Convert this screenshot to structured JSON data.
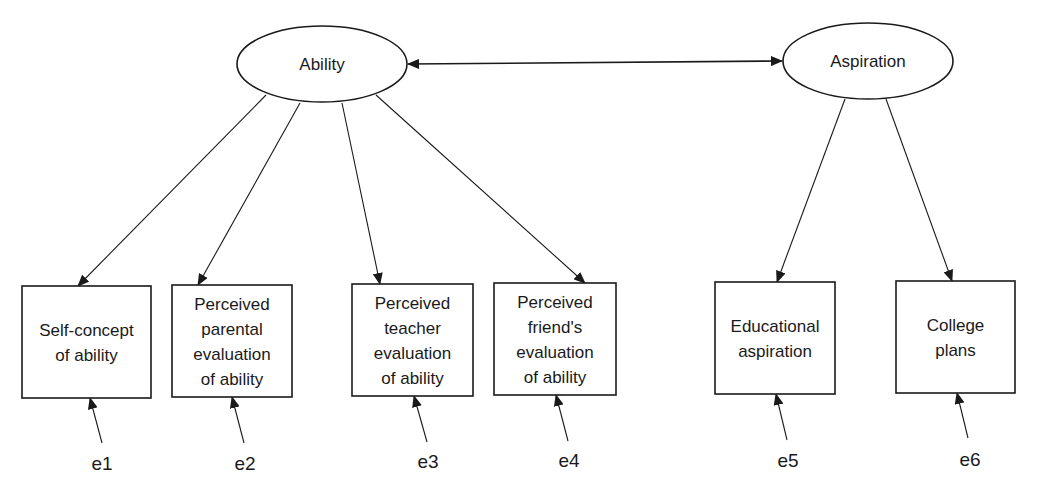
{
  "diagram": {
    "type": "structural-equation-model",
    "stroke_color": "#1a1a1a",
    "background": "#ffffff",
    "latent": [
      {
        "id": "ability",
        "label": "Ability",
        "cx": 322,
        "cy": 64,
        "rx": 85,
        "ry": 38
      },
      {
        "id": "aspiration",
        "label": "Aspiration",
        "cx": 868,
        "cy": 61,
        "rx": 85,
        "ry": 38
      }
    ],
    "correlation": {
      "from": "ability",
      "to": "aspiration",
      "type": "double-headed"
    },
    "observed": [
      {
        "id": "v1",
        "lines": [
          "Self-concept",
          "of ability"
        ],
        "x": 22,
        "y": 286,
        "w": 129,
        "h": 112,
        "factor": "ability",
        "error": "e1"
      },
      {
        "id": "v2",
        "lines": [
          "Perceived",
          "parental",
          "evaluation",
          "of ability"
        ],
        "x": 172,
        "y": 285,
        "w": 120,
        "h": 112,
        "factor": "ability",
        "error": "e2"
      },
      {
        "id": "v3",
        "lines": [
          "Perceived",
          "teacher",
          "evaluation",
          "of ability"
        ],
        "x": 352,
        "y": 284,
        "w": 121,
        "h": 112,
        "factor": "ability",
        "error": "e3"
      },
      {
        "id": "v4",
        "lines": [
          "Perceived",
          "friend's",
          "evaluation",
          "of ability"
        ],
        "x": 494,
        "y": 283,
        "w": 122,
        "h": 112,
        "factor": "ability",
        "error": "e4"
      },
      {
        "id": "v5",
        "lines": [
          "Educational",
          "aspiration"
        ],
        "x": 715,
        "y": 282,
        "w": 120,
        "h": 112,
        "factor": "aspiration",
        "error": "e5"
      },
      {
        "id": "v6",
        "lines": [
          "College",
          "plans"
        ],
        "x": 896,
        "y": 281,
        "w": 119,
        "h": 112,
        "factor": "aspiration",
        "error": "e6"
      }
    ],
    "loadings": [
      {
        "from": "ability",
        "to": "v1",
        "x1": 266,
        "y1": 95,
        "x2": 78,
        "y2": 286
      },
      {
        "from": "ability",
        "to": "v2",
        "x1": 300,
        "y1": 103,
        "x2": 198,
        "y2": 285
      },
      {
        "from": "ability",
        "to": "v3",
        "x1": 342,
        "y1": 103,
        "x2": 380,
        "y2": 284
      },
      {
        "from": "ability",
        "to": "v4",
        "x1": 376,
        "y1": 95,
        "x2": 585,
        "y2": 283
      },
      {
        "from": "aspiration",
        "to": "v5",
        "x1": 845,
        "y1": 99,
        "x2": 777,
        "y2": 282
      },
      {
        "from": "aspiration",
        "to": "v6",
        "x1": 886,
        "y1": 99,
        "x2": 952,
        "y2": 281
      }
    ],
    "errors": [
      {
        "label": "e1",
        "tx": 102,
        "ty": 470,
        "x1": 102,
        "y1": 443,
        "x2": 90,
        "y2": 398
      },
      {
        "label": "e2",
        "tx": 245,
        "ty": 470,
        "x1": 244,
        "y1": 443,
        "x2": 232,
        "y2": 397
      },
      {
        "label": "e3",
        "tx": 428,
        "ty": 468,
        "x1": 427,
        "y1": 442,
        "x2": 414,
        "y2": 396
      },
      {
        "label": "e4",
        "tx": 569,
        "ty": 467,
        "x1": 568,
        "y1": 441,
        "x2": 556,
        "y2": 395
      },
      {
        "label": "e5",
        "tx": 788,
        "ty": 467,
        "x1": 787,
        "y1": 440,
        "x2": 776,
        "y2": 394
      },
      {
        "label": "e6",
        "tx": 970,
        "ty": 466,
        "x1": 968,
        "y1": 438,
        "x2": 957,
        "y2": 393
      }
    ]
  }
}
